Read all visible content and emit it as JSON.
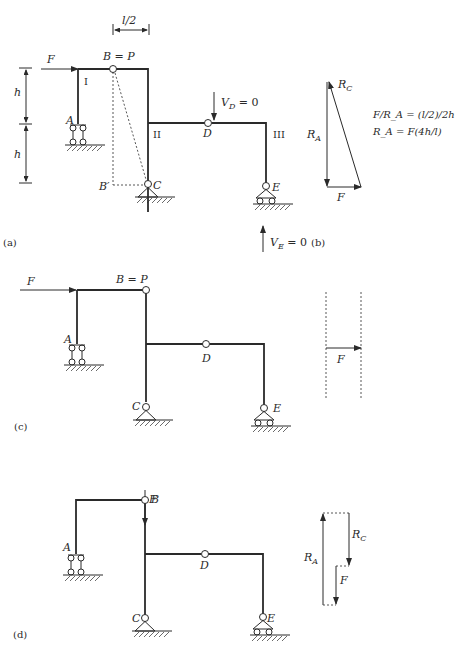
{
  "figure": {
    "panels": [
      {
        "id": "a",
        "caption": "(a)",
        "labels": {
          "F": "F",
          "B": "B = P",
          "A": "A",
          "C": "C",
          "D": "D",
          "E": "E",
          "B_prime": "B′",
          "member_I": "I",
          "member_II": "II",
          "member_III": "III",
          "h_top": "h",
          "h_bottom": "h",
          "half_span": "l/2",
          "VD": "V",
          "VD_sub": "D",
          "VD_eq": " = 0",
          "VE": "V",
          "VE_sub": "E",
          "VE_eq": " = 0"
        }
      },
      {
        "id": "b",
        "caption": "(b)",
        "labels": {
          "RC": "R",
          "RC_sub": "C",
          "RA": "R",
          "RA_sub": "A",
          "F": "F",
          "eq1": "F/R_A = (l/2)/2h",
          "eq2": "R_A = F(4h/l)"
        }
      },
      {
        "id": "c",
        "caption": "(c)",
        "labels": {
          "F": "F",
          "B": "B = P",
          "A": "A",
          "C": "C",
          "D": "D",
          "E": "E",
          "F_polygon": "F"
        }
      },
      {
        "id": "d",
        "caption": "(d)",
        "labels": {
          "F": "F",
          "B": "B",
          "A": "A",
          "C": "C",
          "D": "D",
          "E": "E",
          "RA": "R",
          "RA_sub": "A",
          "RC": "R",
          "RC_sub": "C",
          "F_polygon": "F"
        }
      }
    ]
  }
}
